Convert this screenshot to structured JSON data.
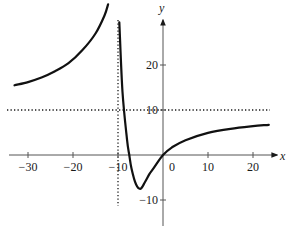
{
  "chart_data": {
    "type": "line",
    "title": "",
    "xlabel": "x",
    "ylabel": "y",
    "xlim": [
      -34,
      25
    ],
    "ylim": [
      -16,
      30
    ],
    "grid": false,
    "x_ticks": [
      -30,
      -20,
      -10,
      0,
      10,
      20
    ],
    "x_tick_labels": [
      "−30",
      "−20",
      "−10",
      "0",
      "10",
      "20"
    ],
    "y_ticks": [
      -10,
      10,
      20
    ],
    "y_tick_labels": [
      "−10",
      "10",
      "20"
    ],
    "asymptotes": [
      {
        "type": "vertical",
        "x": -10,
        "style": "dotted"
      },
      {
        "type": "horizontal",
        "y": 10,
        "style": "dotted"
      }
    ],
    "series": [
      {
        "name": "left-branch",
        "x": [
          -33,
          -30,
          -27,
          -24,
          -21,
          -18,
          -15,
          -13,
          -12.2
        ],
        "y": [
          15.5,
          16.2,
          17.2,
          18.6,
          20.4,
          23.2,
          27.0,
          31.0,
          33.5
        ]
      },
      {
        "name": "right-branch",
        "x": [
          -9.7,
          -9,
          -8,
          -7.5,
          -7,
          -6,
          -5,
          -4,
          -3,
          -2,
          0,
          2,
          5,
          10,
          15,
          20,
          23.5
        ],
        "y": [
          29.5,
          14,
          3.5,
          0,
          -3,
          -6.5,
          -7.5,
          -6,
          -4.2,
          -2.8,
          0,
          1.7,
          3.3,
          4.9,
          5.8,
          6.4,
          6.7
        ]
      }
    ]
  }
}
